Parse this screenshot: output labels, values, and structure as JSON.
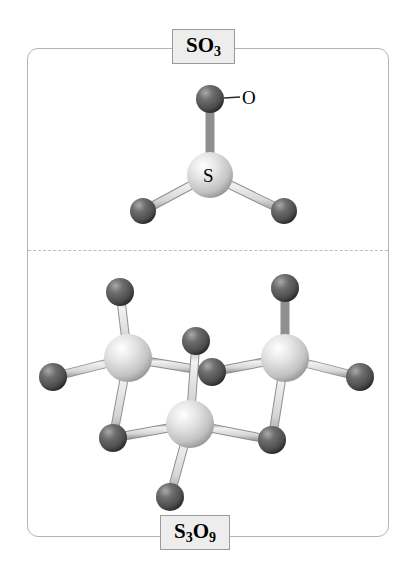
{
  "figure": {
    "name": "sulfur-trioxide-monomer-and-trimer-structures",
    "panel": {
      "border_color": "#b4b4b4",
      "divider_style": "dashed",
      "divider_color": "#bcbcbc"
    },
    "labels": {
      "top": {
        "text": "SO3",
        "formula_main": "SO",
        "formula_sub": "3",
        "box_fill": "#ededed",
        "box_border": "#9a9a9a"
      },
      "bottom": {
        "text": "S3O9",
        "formula_parts": [
          "S",
          "3",
          "O",
          "9"
        ],
        "box_fill": "#ededed",
        "box_border": "#9a9a9a"
      }
    },
    "atom_colors": {
      "sulfur": "#dedede",
      "sulfur_shade": "#9d9d9d",
      "oxygen": "#595959",
      "oxygen_shade": "#2e2e2e",
      "bond": "#d2d2d2",
      "bond_edge": "#8f8f8f"
    },
    "monomer": {
      "name": "SO3",
      "geometry": "trigonal planar",
      "atom_labels": [
        {
          "element": "S",
          "text": "S",
          "x": 210,
          "y": 175
        },
        {
          "element": "O",
          "text": "O",
          "x": 249,
          "y": 97
        }
      ],
      "atoms": [
        {
          "id": "S1",
          "element": "S",
          "x": 210,
          "y": 175,
          "r": 23
        },
        {
          "id": "O1",
          "element": "O",
          "x": 210,
          "y": 99,
          "r": 14
        },
        {
          "id": "O2",
          "element": "O",
          "x": 143,
          "y": 211,
          "r": 13
        },
        {
          "id": "O3",
          "element": "O",
          "x": 284,
          "y": 211,
          "r": 13
        }
      ],
      "bonds": [
        {
          "from": "S1",
          "to": "O1"
        },
        {
          "from": "S1",
          "to": "O2"
        },
        {
          "from": "S1",
          "to": "O3"
        }
      ]
    },
    "trimer": {
      "name": "S3O9",
      "geometry": "six-membered S-O ring with terminal oxygens",
      "atoms": [
        {
          "id": "S_left",
          "element": "S",
          "x": 128,
          "y": 358,
          "r": 24
        },
        {
          "id": "S_right",
          "element": "S",
          "x": 285,
          "y": 358,
          "r": 24
        },
        {
          "id": "S_front",
          "element": "S",
          "x": 190,
          "y": 424,
          "r": 24
        },
        {
          "id": "Ob_mid",
          "element": "O",
          "x": 212,
          "y": 372,
          "r": 14
        },
        {
          "id": "Ob_left",
          "element": "O",
          "x": 113,
          "y": 438,
          "r": 14
        },
        {
          "id": "Ob_right",
          "element": "O",
          "x": 272,
          "y": 440,
          "r": 14
        },
        {
          "id": "Ot_lt",
          "element": "O",
          "x": 120,
          "y": 292,
          "r": 14
        },
        {
          "id": "Ot_lw",
          "element": "O",
          "x": 53,
          "y": 377,
          "r": 14
        },
        {
          "id": "Ot_rt",
          "element": "O",
          "x": 285,
          "y": 288,
          "r": 14
        },
        {
          "id": "Ot_rw",
          "element": "O",
          "x": 360,
          "y": 377,
          "r": 14
        },
        {
          "id": "Ot_fu",
          "element": "O",
          "x": 196,
          "y": 341,
          "r": 14
        },
        {
          "id": "Ot_fd",
          "element": "O",
          "x": 170,
          "y": 497,
          "r": 14
        }
      ],
      "bonds": [
        {
          "from": "S_left",
          "to": "Ob_mid"
        },
        {
          "from": "S_right",
          "to": "Ob_mid"
        },
        {
          "from": "S_left",
          "to": "Ob_left"
        },
        {
          "from": "S_front",
          "to": "Ob_left"
        },
        {
          "from": "S_right",
          "to": "Ob_right"
        },
        {
          "from": "S_front",
          "to": "Ob_right"
        },
        {
          "from": "S_left",
          "to": "Ot_lt"
        },
        {
          "from": "S_left",
          "to": "Ot_lw"
        },
        {
          "from": "S_right",
          "to": "Ot_rt"
        },
        {
          "from": "S_right",
          "to": "Ot_rw"
        },
        {
          "from": "S_front",
          "to": "Ot_fu"
        },
        {
          "from": "S_front",
          "to": "Ot_fd"
        }
      ]
    }
  }
}
